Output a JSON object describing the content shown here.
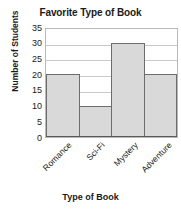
{
  "chart_data": {
    "type": "bar",
    "title": "Favorite Type of Book",
    "xlabel": "Type of Book",
    "ylabel": "Number of Students",
    "categories": [
      "Romance",
      "Sci-Fi",
      "Mystery",
      "Adventure"
    ],
    "values": [
      20,
      10,
      30,
      20
    ],
    "ylim": [
      0,
      35
    ],
    "ytick_labels": [
      "0",
      "5",
      "10",
      "15",
      "20",
      "25",
      "30",
      "35"
    ],
    "ytick_values": [
      0,
      5,
      10,
      15,
      20,
      25,
      30,
      35
    ],
    "grid": true,
    "legend": false,
    "legend_position": "none",
    "bar_fill_color": "#d9d9d9",
    "bar_edge_color": "#6d6d6d",
    "gridline_color": "#c9c9c9",
    "frame_color": "#b9b9b9",
    "background_color": "#ffffff",
    "text_color": "#1a1a1a",
    "xtick_label_rotation": -45
  }
}
